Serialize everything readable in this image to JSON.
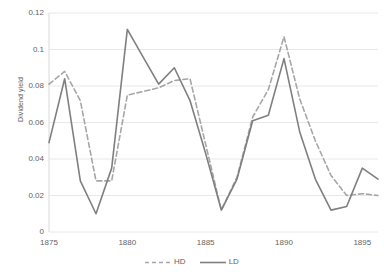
{
  "chart_data": {
    "type": "line",
    "title": "",
    "xlabel": "",
    "ylabel": "Dividend yield",
    "xlim": [
      1875,
      1896
    ],
    "ylim": [
      0,
      0.12
    ],
    "grid": true,
    "legend_position": "bottom",
    "x": [
      1875,
      1876,
      1877,
      1878,
      1879,
      1880,
      1881,
      1882,
      1883,
      1884,
      1885,
      1886,
      1887,
      1888,
      1889,
      1890,
      1891,
      1892,
      1893,
      1894,
      1895,
      1896
    ],
    "y_ticks": [
      0,
      0.02,
      0.04,
      0.06,
      0.08,
      0.1,
      0.12
    ],
    "y_tick_labels": [
      "0",
      "0.02",
      "0.04",
      "0.06",
      "0.08",
      "0.1",
      "0.12"
    ],
    "x_ticks": [
      1875,
      1880,
      1885,
      1890,
      1895
    ],
    "x_tick_labels": [
      "1875",
      "1880",
      "1885",
      "1890",
      "1895"
    ],
    "series": [
      {
        "name": "HD",
        "style": "dashed",
        "color": "#a6a6a6",
        "values": [
          0.081,
          0.088,
          0.072,
          0.028,
          0.028,
          0.075,
          0.077,
          0.079,
          0.083,
          0.084,
          0.048,
          0.012,
          0.03,
          0.063,
          0.078,
          0.107,
          0.073,
          0.05,
          0.031,
          0.02,
          0.021,
          0.02
        ]
      },
      {
        "name": "LD",
        "style": "solid",
        "color": "#7f7f7f",
        "values": [
          0.049,
          0.084,
          0.028,
          0.01,
          0.035,
          0.111,
          0.096,
          0.081,
          0.09,
          0.072,
          0.043,
          0.012,
          0.029,
          0.061,
          0.064,
          0.095,
          0.055,
          0.029,
          0.012,
          0.014,
          0.035,
          0.029
        ]
      }
    ],
    "legend": [
      {
        "label": "HD",
        "style": "dashed",
        "color": "#a6a6a6"
      },
      {
        "label": "LD",
        "style": "solid",
        "color": "#7f7f7f"
      }
    ],
    "colors": {
      "background": "#ffffff",
      "gridline": "#e8e8e8",
      "axis_text": "#636363",
      "hd_line": "#a6a6a6",
      "ld_line": "#7f7f7f"
    }
  }
}
